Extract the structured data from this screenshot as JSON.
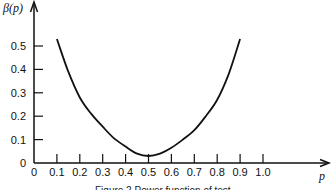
{
  "chart_data": {
    "type": "line",
    "title": "",
    "caption": "Figure 2  Power function of test",
    "xlabel": "p",
    "ylabel": "β(p)",
    "xlim": [
      0,
      1.0
    ],
    "ylim": [
      0,
      0.55
    ],
    "grid": false,
    "x_ticks": [
      "0",
      "0.1",
      "0.2",
      "0.3",
      "0.4",
      "0.5",
      "0.6",
      "0.7",
      "0.8",
      "0.9",
      "1.0"
    ],
    "y_ticks": [
      "0",
      "0.1",
      "0.2",
      "0.3",
      "0.4",
      "0.5"
    ],
    "series": [
      {
        "name": "β(p)",
        "x": [
          0.1,
          0.15,
          0.2,
          0.25,
          0.3,
          0.35,
          0.4,
          0.45,
          0.5,
          0.55,
          0.6,
          0.65,
          0.7,
          0.75,
          0.8,
          0.85,
          0.9
        ],
        "values": [
          0.53,
          0.39,
          0.28,
          0.21,
          0.155,
          0.105,
          0.07,
          0.04,
          0.03,
          0.04,
          0.065,
          0.1,
          0.14,
          0.2,
          0.27,
          0.38,
          0.53
        ]
      }
    ]
  }
}
